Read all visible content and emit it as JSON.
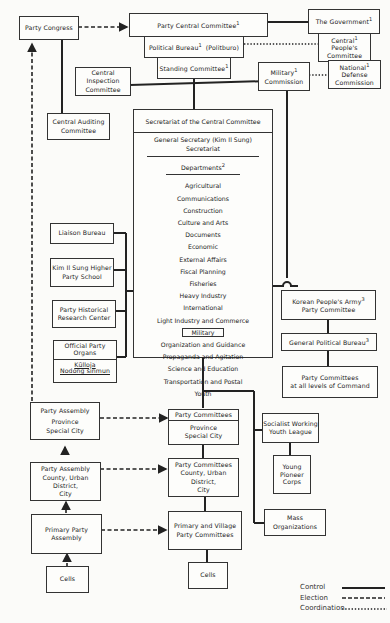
{
  "diagram": {
    "nodes": {
      "party_congress": "Party Congress",
      "party_central_committee": "Party Central Committee",
      "political_bureau": "Political Bureau",
      "politburo": "(Politburo)",
      "standing_committee": "Standing Committee",
      "the_government": "The Government",
      "central_peoples_committee_1": "Central",
      "central_peoples_committee_2": "People's",
      "central_peoples_committee_3": "Committee",
      "national_defense_1": "National",
      "national_defense_2": "Defense",
      "national_defense_3": "Commission",
      "military_commission_1": "Military",
      "military_commission_2": "Commission",
      "central_inspection_1": "Central Inspection",
      "central_inspection_2": "Committee",
      "central_auditing_1": "Central Auditing",
      "central_auditing_2": "Committee",
      "liaison_bureau": "Liaison Bureau",
      "kim_school_1": "Kim Il Sung Higher",
      "kim_school_2": "Party School",
      "historical_1": "Party Historical",
      "historical_2": "Research Center",
      "official_organs_1": "Official Party",
      "official_organs_2": "Organs",
      "kulloja": "Kŭlloja",
      "nodong": "Nodong sinmun",
      "kpa_1": "Korean People's Army",
      "kpa_2": "Party Committee",
      "gpb": "General Political Bureau",
      "pc_command_1": "Party Committees",
      "pc_command_2": "at all levels of Command",
      "assembly_province_1": "Party Assembly",
      "assembly_province_2": "Province",
      "assembly_province_3": "Special City",
      "committees_province_1": "Party Committees",
      "committees_province_2": "Province",
      "committees_province_3": "Special City",
      "socialist_youth_1": "Socialist Working",
      "socialist_youth_2": "Youth League",
      "young_pioneer_1": "Young",
      "young_pioneer_2": "Pioneer",
      "young_pioneer_3": "Corps",
      "assembly_county_1": "Party Assembly",
      "assembly_county_2": "County, Urban District,",
      "assembly_county_3": "City",
      "committees_county_1": "Party Committees",
      "committees_county_2": "County, Urban District,",
      "committees_county_3": "City",
      "mass_org_1": "Mass",
      "mass_org_2": "Organizations",
      "primary_assembly_1": "Primary Party",
      "primary_assembly_2": "Assembly",
      "primary_committees_1": "Primary and Village",
      "primary_committees_2": "Party Committees",
      "cells_left": "Cells",
      "cells_right": "Cells"
    },
    "footnotes": {
      "one": "1",
      "two": "2",
      "three": "3"
    },
    "secretariat": {
      "header": "Secretariat of the Central Committee",
      "general_secretary": "General Secretary (Kim Il Sung)",
      "secretariat": "Secretariat",
      "departments": "Departments",
      "items": [
        "Agricultural",
        "Communications",
        "Construction",
        "Culture and Arts",
        "Documents",
        "Economic",
        "External Affairs",
        "Fiscal Planning",
        "Fisheries",
        "Heavy Industry",
        "International",
        "Light Industry and Commerce",
        "Military",
        "Organization and Guidance",
        "Propaganda and Agitation",
        "Science and Education",
        "Transportation and Postal",
        "Youth"
      ]
    },
    "legend": {
      "control": "Control",
      "election": "Election",
      "coordination": "Coordination"
    }
  }
}
